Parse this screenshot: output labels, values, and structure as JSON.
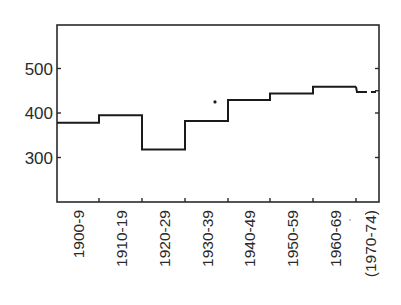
{
  "chart_data": {
    "type": "line",
    "subtype": "step",
    "title": "",
    "xlabel": "",
    "ylabel": "",
    "ylim": [
      200,
      590
    ],
    "yticks": [
      300,
      400,
      500
    ],
    "grid": false,
    "legend": null,
    "categories": [
      "1900-9",
      "1910-19",
      "1920-29",
      "1930-39",
      "1940-49",
      "1950-59",
      "1960-69",
      "(1970-74)"
    ],
    "series": [
      {
        "name": "decade average",
        "values": [
          378,
          395,
          318,
          382,
          429,
          444,
          459,
          447
        ],
        "style": [
          "solid",
          "solid",
          "solid",
          "solid",
          "solid",
          "solid",
          "solid",
          "dashed"
        ]
      }
    ],
    "annotations": [
      {
        "type": "point",
        "between": [
          "1930-39",
          "1940-49"
        ],
        "value": 425
      }
    ]
  },
  "colors": {
    "line": "#1a1a1a",
    "axis": "#2a2a2a",
    "text": "#2a2a2a",
    "background": "#ffffff"
  }
}
